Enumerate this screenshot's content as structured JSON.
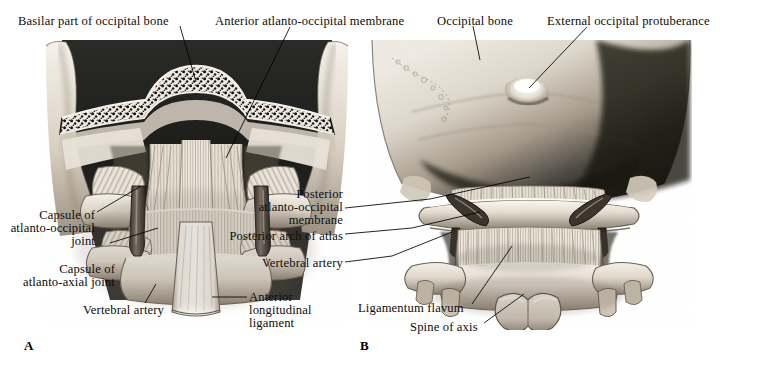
{
  "figure": {
    "panels": [
      {
        "id": "A",
        "letter": "A",
        "letter_pos": {
          "x": 24,
          "y": 338
        },
        "labels": [
          {
            "name": "basilar-part-of-occipital-bone",
            "lines": [
              "Basilar part of occipital bone"
            ],
            "x": 18,
            "y": 16,
            "align": "left"
          },
          {
            "name": "anterior-atlanto-occipital-membrane",
            "lines": [
              "Anterior atlanto-occipital membrane"
            ],
            "x": 215,
            "y": 16,
            "align": "left"
          },
          {
            "name": "capsule-of-atlanto-occipital-joint",
            "lines": [
              "Capsule of",
              "atlanto-occipital",
              "joint"
            ],
            "x": 0,
            "y": 210,
            "align": "right",
            "right": 663
          },
          {
            "name": "capsule-of-atlanto-axial-joint",
            "lines": [
              "Capsule of",
              "atlanto-axial joint"
            ],
            "x": 0,
            "y": 264,
            "align": "right",
            "right": 643
          },
          {
            "name": "vertebral-artery-a",
            "lines": [
              "Vertebral artery"
            ],
            "x": 83,
            "y": 304,
            "align": "left"
          },
          {
            "name": "anterior-longitudinal-ligament",
            "lines": [
              "Anterior",
              "longitudinal",
              "ligament"
            ],
            "x": 249,
            "y": 291,
            "align": "left"
          }
        ]
      },
      {
        "id": "B",
        "letter": "B",
        "letter_pos": {
          "x": 360,
          "y": 338
        },
        "labels": [
          {
            "name": "occipital-bone",
            "lines": [
              "Occipital bone"
            ],
            "x": 437,
            "y": 16,
            "align": "left"
          },
          {
            "name": "external-occipital-protuberance",
            "lines": [
              "External occipital protuberance"
            ],
            "x": 547,
            "y": 16,
            "align": "left"
          },
          {
            "name": "posterior-atlanto-occipital-membrane",
            "lines": [
              "Posterior",
              "atlanto-occipital",
              "membrane"
            ],
            "x": 0,
            "y": 189,
            "align": "right",
            "right": 343
          },
          {
            "name": "posterior-arch-of-atlas",
            "lines": [
              "Posterior arch of atlas"
            ],
            "x": 0,
            "y": 231,
            "align": "right",
            "right": 343
          },
          {
            "name": "vertebral-artery-b",
            "lines": [
              "Vertebral artery"
            ],
            "x": 0,
            "y": 258,
            "align": "right",
            "right": 343
          },
          {
            "name": "ligamentum-flavum",
            "lines": [
              "Ligamentum flavum"
            ],
            "x": 358,
            "y": 302,
            "align": "left"
          },
          {
            "name": "spine-of-axis",
            "lines": [
              "Spine of axis"
            ],
            "x": 410,
            "y": 321,
            "align": "left"
          }
        ]
      }
    ],
    "colors": {
      "background": "#ffffff",
      "ink": "#0d0d0d",
      "leader": "#000000",
      "bone_light": "#efeae2",
      "bone_mid": "#c9c0b4",
      "bone_shadow": "#6d6357",
      "dark": "#1a1a1a"
    }
  }
}
